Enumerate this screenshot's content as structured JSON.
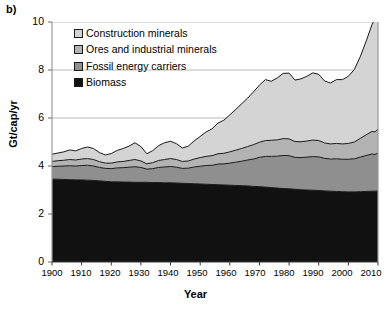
{
  "panel": {
    "label": "b)"
  },
  "axes": {
    "ylabel": "Gt/cap/yr",
    "xlabel": "Year",
    "yticks": [
      "0",
      "2",
      "4",
      "6",
      "8",
      "10"
    ],
    "xticks": [
      "1900",
      "1910",
      "1920",
      "1930",
      "1940",
      "1950",
      "1960",
      "1970",
      "1980",
      "1990",
      "2000",
      "2010"
    ]
  },
  "legend": {
    "items": [
      {
        "label": "Construction minerals",
        "color": "#d4d4d4"
      },
      {
        "label": "Ores and industrial minerals",
        "color": "#b3b3b3"
      },
      {
        "label": "Fossil energy carriers",
        "color": "#8f8f8f"
      },
      {
        "label": "Biomass",
        "color": "#111111"
      }
    ]
  },
  "chart_data": {
    "type": "area",
    "title": "",
    "xlabel": "Year",
    "ylabel": "Gt/cap/yr",
    "xlim": [
      1900,
      2010
    ],
    "ylim": [
      0,
      10
    ],
    "grid": true,
    "gridlines": [
      6,
      8,
      10
    ],
    "legend_position": "top-left",
    "stacked": true,
    "stack_order_bottom_to_top": [
      "Biomass",
      "Fossil energy carriers",
      "Ores and industrial minerals",
      "Construction minerals"
    ],
    "x": [
      1900,
      1902,
      1904,
      1906,
      1908,
      1910,
      1912,
      1914,
      1916,
      1918,
      1920,
      1922,
      1924,
      1926,
      1928,
      1930,
      1932,
      1934,
      1936,
      1938,
      1940,
      1942,
      1944,
      1946,
      1948,
      1950,
      1952,
      1954,
      1956,
      1958,
      1960,
      1962,
      1964,
      1966,
      1968,
      1970,
      1972,
      1974,
      1976,
      1978,
      1980,
      1982,
      1984,
      1986,
      1988,
      1990,
      1992,
      1994,
      1996,
      1998,
      2000,
      2002,
      2004,
      2006,
      2008,
      2009,
      2010
    ],
    "series": [
      {
        "name": "Biomass",
        "color": "#111111",
        "values": [
          3.45,
          3.45,
          3.44,
          3.43,
          3.42,
          3.42,
          3.41,
          3.4,
          3.38,
          3.36,
          3.34,
          3.34,
          3.33,
          3.33,
          3.32,
          3.32,
          3.32,
          3.31,
          3.31,
          3.3,
          3.3,
          3.29,
          3.28,
          3.27,
          3.26,
          3.25,
          3.24,
          3.23,
          3.22,
          3.21,
          3.2,
          3.19,
          3.18,
          3.17,
          3.15,
          3.14,
          3.12,
          3.1,
          3.08,
          3.06,
          3.05,
          3.03,
          3.01,
          3.0,
          2.99,
          2.98,
          2.96,
          2.95,
          2.94,
          2.93,
          2.92,
          2.92,
          2.93,
          2.94,
          2.95,
          2.95,
          2.96
        ]
      },
      {
        "name": "Fossil energy carriers",
        "color": "#8f8f8f",
        "values": [
          0.52,
          0.54,
          0.56,
          0.58,
          0.58,
          0.6,
          0.62,
          0.6,
          0.56,
          0.54,
          0.55,
          0.58,
          0.6,
          0.62,
          0.65,
          0.62,
          0.55,
          0.58,
          0.63,
          0.66,
          0.68,
          0.66,
          0.62,
          0.64,
          0.7,
          0.74,
          0.78,
          0.8,
          0.86,
          0.88,
          0.92,
          0.97,
          1.02,
          1.08,
          1.14,
          1.22,
          1.28,
          1.3,
          1.33,
          1.38,
          1.38,
          1.33,
          1.34,
          1.37,
          1.4,
          1.4,
          1.36,
          1.34,
          1.36,
          1.35,
          1.36,
          1.38,
          1.44,
          1.5,
          1.55,
          1.53,
          1.58
        ]
      },
      {
        "name": "Ores and industrial minerals",
        "color": "#b3b3b3",
        "values": [
          0.22,
          0.23,
          0.24,
          0.26,
          0.25,
          0.27,
          0.28,
          0.27,
          0.24,
          0.22,
          0.23,
          0.25,
          0.26,
          0.28,
          0.3,
          0.27,
          0.22,
          0.25,
          0.29,
          0.31,
          0.33,
          0.32,
          0.29,
          0.3,
          0.33,
          0.36,
          0.38,
          0.4,
          0.43,
          0.44,
          0.47,
          0.5,
          0.53,
          0.56,
          0.6,
          0.63,
          0.66,
          0.67,
          0.68,
          0.7,
          0.7,
          0.66,
          0.66,
          0.67,
          0.69,
          0.68,
          0.64,
          0.63,
          0.64,
          0.64,
          0.66,
          0.7,
          0.78,
          0.86,
          0.94,
          0.94,
          1.0
        ]
      },
      {
        "name": "Construction minerals",
        "color": "#d4d4d4",
        "values": [
          0.3,
          0.32,
          0.35,
          0.4,
          0.38,
          0.44,
          0.48,
          0.46,
          0.38,
          0.34,
          0.4,
          0.48,
          0.54,
          0.6,
          0.7,
          0.6,
          0.42,
          0.5,
          0.62,
          0.7,
          0.72,
          0.66,
          0.56,
          0.62,
          0.76,
          0.88,
          1.02,
          1.12,
          1.28,
          1.38,
          1.54,
          1.7,
          1.86,
          2.02,
          2.2,
          2.38,
          2.54,
          2.46,
          2.58,
          2.72,
          2.74,
          2.56,
          2.62,
          2.7,
          2.8,
          2.76,
          2.58,
          2.54,
          2.66,
          2.68,
          2.8,
          3.02,
          3.4,
          3.9,
          4.46,
          4.7,
          5.46
        ]
      }
    ],
    "total_endpoints": {
      "1900": 4.49,
      "2010": 11.0
    }
  }
}
